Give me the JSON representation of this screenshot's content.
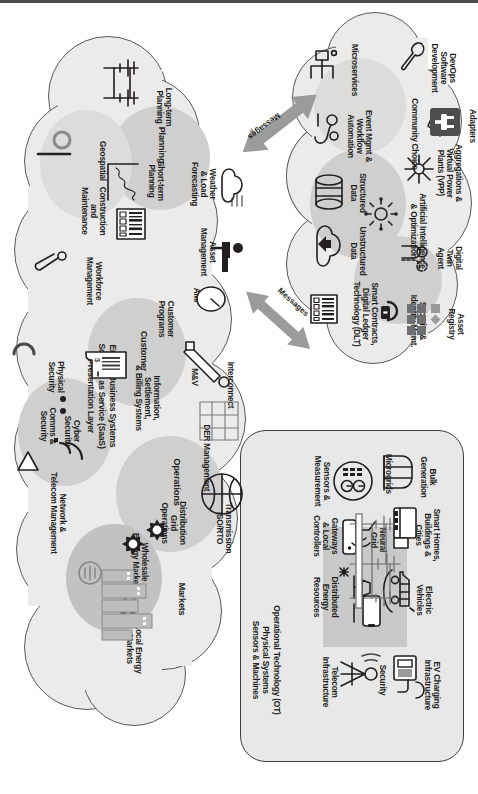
{
  "diagram": {
    "layers": [
      {
        "id": "it-platform",
        "name": "Digital Platform / Information Technology Cloud",
        "items": [
          "Microservices",
          "Event Mgmt & Workflow Automation",
          "Structured Data",
          "Unstructured Data",
          "Smart Contracts, Digital Ledger Technology (DLT)",
          "Security & Identity Mgmt.",
          "Asset Registry",
          "Artificial Intelligence & Optimization",
          "Digital Twin Agent",
          "Aggregations & Virtual Power Plants (VPP)",
          "Community Choice",
          "DevOps Software Development",
          "Adapters"
        ]
      },
      {
        "id": "ot",
        "name": "Operational Technology (OT) Physical Systems Sensors & Machines",
        "items": [
          "Sensors & Measurement",
          "Gateways & Local Controllers",
          "Distributed Energy Resources",
          "Telecom Infrastructure",
          "Security",
          "EV Charging Infrastructure",
          "Electric Vehicles",
          "Smart Homes, Buildings & Cities",
          "Bulk Generation",
          "Microgrids",
          "Neural Grid"
        ]
      },
      {
        "id": "business",
        "name": "Energy Business Systems Software as Service (SaaS) Presentation Layer",
        "items": [
          "Long-term Planning",
          "Planning",
          "Short-term Planning",
          "Weather & Load Forecasting",
          "Asset Management",
          "Geospatial",
          "Construction and Maintenance",
          "Workforce Management",
          "Customer",
          "Customer Programs",
          "AMI",
          "M&V",
          "Interconnect",
          "Information, Settlement, & Billing Systems",
          "DER Management",
          "Operations",
          "Transmission ISO/RTO",
          "Distribution Grid Operations",
          "Markets",
          "Wholesale Energy Markets",
          "Carbon Markets",
          "Local Energy Markets",
          "Cyber Security",
          "Physical Security",
          "Comms & Security",
          "Network & Telecom Management"
        ]
      }
    ],
    "connectors": [
      {
        "id": "messages-top",
        "label": "Messages"
      },
      {
        "id": "messages-bottom",
        "label": "Messages"
      }
    ],
    "colors": {
      "cloud_fill": "#ebebeb",
      "cloud_stroke": "#58595b",
      "blob": "#cfcfcf",
      "ot_panel": "#c9c9c9",
      "arrow": "#9b9b9b",
      "ink": "#231f20",
      "adapters_badge": "#4d4d4d"
    }
  },
  "it": {
    "microservices": "Microservices",
    "event_mgmt": "Event Mgmt &\nWorkflow\nAutomation",
    "event_mgmt_l1": "Event Mgmt &",
    "event_mgmt_l2": "Workflow",
    "event_mgmt_l3": "Automation",
    "structured_l1": "Structured",
    "structured_l2": "Data",
    "unstructured_l1": "Unstructured",
    "unstructured_l2": "Data",
    "dlt_l1": "Smart Contracts,",
    "dlt_l2": "Digital Ledger",
    "dlt_l3": "Technology (DLT)",
    "security_l1": "Security &",
    "security_l2": "Identity Mgmt.",
    "asset_registry_l1": "Asset",
    "asset_registry_l2": "Registry",
    "ai_l1": "Artificial Intelligence",
    "ai_l2": "& Optimization",
    "twin_l1": "Digital",
    "twin_l2": "Twin",
    "twin_l3": "Agent",
    "vpp_l1": "Aggregations &",
    "vpp_l2": "Virtual Power",
    "vpp_l3": "Plants (VPP)",
    "community_choice": "Community Choice",
    "devops_l1": "DevOps",
    "devops_l2": "Software",
    "devops_l3": "Development",
    "adapters": "Adapters"
  },
  "ot": {
    "sensors_l1": "Sensors &",
    "sensors_l2": "Measurement",
    "gateways_l1": "Gateways",
    "gateways_l2": "& Local",
    "gateways_l3": "Controllers",
    "der_l1": "Distributed",
    "der_l2": "Energy",
    "der_l3": "Resources",
    "telecom_l1": "Telecom",
    "telecom_l2": "Infrastructure",
    "security": "Security",
    "ev_charging_l1": "EV Charging",
    "ev_charging_l2": "Infrastructure",
    "ev_l1": "Electric",
    "ev_l2": "Vehicles",
    "smart_homes_l1": "Smart Homes,",
    "smart_homes_l2": "Buildings &",
    "smart_homes_l3": "Cities",
    "bulk_l1": "Bulk",
    "bulk_l2": "Generation",
    "microgrids": "Microgrids",
    "neural_l1": "Neural",
    "neural_l2": "Grid",
    "caption_l1": "Operational Technology (OT)",
    "caption_l2": "Physical Systems",
    "caption_l3": "Sensors & Machines"
  },
  "biz": {
    "longterm_l1": "Long-term",
    "longterm_l2": "Planning",
    "planning": "Planning",
    "shortterm_l1": "Short-term",
    "shortterm_l2": "Planning",
    "weather_l1": "Weather",
    "weather_l2": "& Load",
    "weather_l3": "Forecasting",
    "asset_l1": "Asset",
    "asset_l2": "Management",
    "geospatial": "Geospatial",
    "construction_l1": "Construction",
    "construction_l2": "and",
    "construction_l3": "Maintenance",
    "workforce_l1": "Workforce",
    "workforce_l2": "Management",
    "customer": "Customer",
    "customer_programs_l1": "Customer",
    "customer_programs_l2": "Programs",
    "ami": "AMI",
    "mv": "M&V",
    "interconnect": "Interconnect",
    "billing_l1": "Information,",
    "billing_l2": "Settlement,",
    "billing_l3": "& Billing Systems",
    "der_mgmt": "DER Management",
    "operations": "Operations",
    "transmission_l1": "Transmission",
    "transmission_l2": "ISO/RTO",
    "distribution_l1": "Distribution",
    "distribution_l2": "Grid",
    "distribution_l3": "Operations",
    "markets": "Markets",
    "wholesale_l1": "Wholesale",
    "wholesale_l2": "Energy Markets",
    "carbon_l1": "Carbon",
    "carbon_l2": "Markets",
    "local_l1": "Local Energy",
    "local_l2": "Markets",
    "cyber_l1": "Cyber",
    "cyber_l2": "Security",
    "physical_l1": "Physical",
    "physical_l2": "Security",
    "comms_l1": "Comms &",
    "comms_l2": "Security",
    "network_l1": "Network &",
    "network_l2": "Telecom Management",
    "caption_l1": "Energy Business Systems",
    "caption_l2": "Software as Service (SaaS)",
    "caption_l3": "Presentation Layer"
  },
  "connectors": {
    "messages_upper": "Messages",
    "messages_lower": "Messages"
  }
}
